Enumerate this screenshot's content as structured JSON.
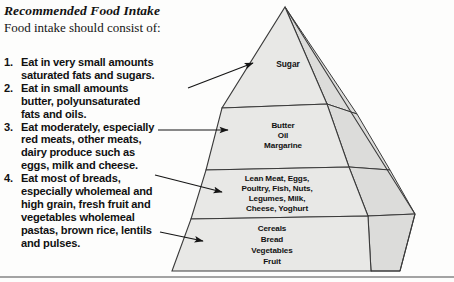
{
  "heading": "Recommended Food Intake",
  "intro": "Food intake should consist of:",
  "list": [
    {
      "number": "1.",
      "lines": [
        "Eat in very small amounts",
        "saturated fats and sugars."
      ]
    },
    {
      "number": "2.",
      "lines": [
        "Eat in small amounts",
        "butter, polyunsaturated",
        "fats and oils."
      ]
    },
    {
      "number": "3.",
      "lines": [
        "Eat moderately, especially",
        "red meats, other meats,",
        "dairy produce such as",
        "eggs, milk and cheese."
      ]
    },
    {
      "number": "4.",
      "lines": [
        "Eat most of breads,",
        "especially wholemeal and",
        "high grain, fresh fruit and",
        "vegetables wholemeal",
        "pastas, brown rice, lentils",
        "and pulses."
      ]
    }
  ],
  "pyramid": {
    "tiers": [
      {
        "name": "sugar",
        "lines": [
          "Sugar"
        ]
      },
      {
        "name": "fats",
        "lines": [
          "Butter",
          "Oil",
          "Margarine"
        ]
      },
      {
        "name": "protein",
        "lines": [
          "Lean Meat, Eggs,",
          "Poultry, Fish, Nuts,",
          "Legumes, Milk,",
          "Cheese, Yoghurt"
        ]
      },
      {
        "name": "grains",
        "lines": [
          "Cereals",
          "Bread",
          "Vegetables",
          "Fruit"
        ]
      }
    ],
    "colors": {
      "front_face": "#e8e8e6",
      "side_face": "#dcdcda",
      "outline": "#3a3a3a",
      "arrow": "#151515"
    }
  },
  "arrows": [
    {
      "name": "arrow-to-sugar"
    },
    {
      "name": "arrow-to-fats"
    },
    {
      "name": "arrow-to-protein"
    },
    {
      "name": "arrow-to-grains"
    }
  ]
}
